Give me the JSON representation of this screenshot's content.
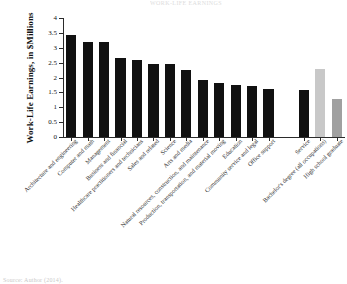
{
  "figure": {
    "title_fragment": "WORK-LIFE EARNINGS",
    "source_note": "Source: Author (2014)."
  },
  "chart_data": {
    "type": "bar",
    "title": "WORK-LIFE EARNINGS",
    "xlabel": "",
    "ylabel": "Work-Life Earnings, in $Millions",
    "ylim": [
      0,
      4
    ],
    "ytick_values": [
      0,
      0.5,
      1,
      1.5,
      2,
      2.5,
      3,
      3.5,
      4
    ],
    "ytick_labels": [
      "0",
      "0.5",
      "1",
      "1.5",
      "2",
      "2.5",
      "3",
      "3.5",
      "4"
    ],
    "grid": false,
    "legend": "none",
    "group_gap_after_index": 12,
    "categories": [
      "Architecture and engineering",
      "Computer and math",
      "Management",
      "Business and financial",
      "Healthcare practitioners and technicians",
      "Sales and related",
      "Science",
      "Arts and media",
      "Natural resources, construction, and maintenance",
      "Production, transportation, and material moving",
      "Education",
      "Community service and legal",
      "Office support",
      "Service",
      "Bachelor's degree (all occupations)",
      "High school graduate"
    ],
    "values": [
      3.42,
      3.2,
      3.2,
      2.67,
      2.59,
      2.47,
      2.46,
      2.26,
      1.93,
      1.83,
      1.74,
      1.73,
      1.6,
      1.58,
      2.3,
      1.28
    ],
    "colors": [
      "#111111",
      "#111111",
      "#111111",
      "#111111",
      "#111111",
      "#111111",
      "#111111",
      "#111111",
      "#111111",
      "#111111",
      "#111111",
      "#111111",
      "#111111",
      "#111111",
      "#c8c8c8",
      "#a0a0a0"
    ],
    "series_groups": [
      {
        "name": "Occupations",
        "color": "#111111",
        "count": 14
      },
      {
        "name": "Education benchmark (bachelor's)",
        "color": "#c8c8c8",
        "count": 1
      },
      {
        "name": "Education benchmark (high school)",
        "color": "#a0a0a0",
        "count": 1
      }
    ]
  }
}
